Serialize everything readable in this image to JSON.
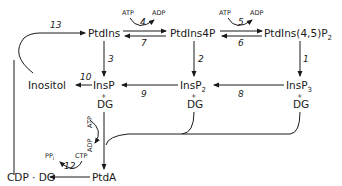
{
  "diagram": {
    "nodes": {
      "ptdins": "PtdIns",
      "ptdins4p": "PtdIns4P",
      "ptdins45p2_main": "PtdIns(4,5)P",
      "ptdins45p2_sub": "2",
      "inositol": "Inositol",
      "insp": "InsP",
      "insp2_main": "InsP",
      "insp2_sub": "2",
      "insp3_main": "InsP",
      "insp3_sub": "3",
      "plus": "+",
      "dg": "DG",
      "cdpdg": "CDP · DG",
      "ptda": "PtdA"
    },
    "cofactors": {
      "atp": "ATP",
      "adp": "ADP",
      "ctp": "CTP",
      "ppi_main": "PP",
      "ppi_sub": "i"
    },
    "reactions": [
      "1",
      "2",
      "3",
      "4",
      "5",
      "6",
      "7",
      "8",
      "9",
      "10",
      "12",
      "13"
    ]
  }
}
